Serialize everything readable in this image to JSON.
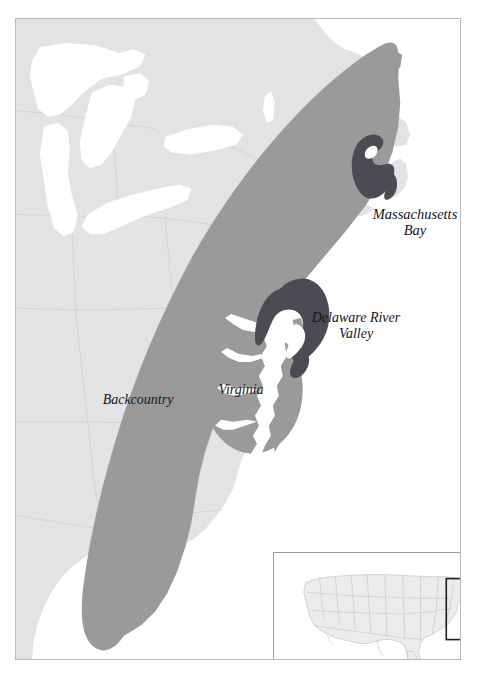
{
  "figure": {
    "kind": "thematic-map",
    "region": "Eastern North America",
    "frame_color": "#b9b9b9",
    "background_color": "#ffffff"
  },
  "palette": {
    "land": "#e3e3e3",
    "land_border": "#cfcfcf",
    "water": "#ffffff",
    "region_fill": "#9a9a9a",
    "hearth_fill": "#4b4b53",
    "inset_land": "#ececec",
    "inset_border": "#c3c3c3",
    "inset_frame": "#9d9d9d",
    "extent_box": "#1d1d1d",
    "label_color": "#16161a"
  },
  "labels": [
    {
      "id": "massachusetts-bay",
      "text": "Massachusetts\nBay",
      "x": 415,
      "y": 221
    },
    {
      "id": "delaware-river-valley",
      "text": "Delaware River\nValley",
      "x": 356,
      "y": 325
    },
    {
      "id": "virginia",
      "text": "Virginia",
      "x": 241,
      "y": 390
    },
    {
      "id": "backcountry",
      "text": "Backcountry",
      "x": 138,
      "y": 400
    }
  ],
  "regions": [
    {
      "id": "backcountry",
      "name": "Backcountry",
      "fill": "#9a9a9a",
      "style": "band"
    },
    {
      "id": "virginia",
      "name": "Virginia",
      "fill": "#9a9a9a",
      "style": "oval"
    },
    {
      "id": "delaware-river-valley",
      "name": "Delaware River Valley",
      "fill": "#4b4b53",
      "style": "blob"
    },
    {
      "id": "massachusetts-bay",
      "name": "Massachusetts Bay",
      "fill": "#4b4b53",
      "style": "blob"
    }
  ],
  "water_features": [
    {
      "id": "lake-superior",
      "name": "Lake Superior"
    },
    {
      "id": "lake-michigan",
      "name": "Lake Michigan"
    },
    {
      "id": "lake-huron",
      "name": "Lake Huron"
    },
    {
      "id": "lake-erie",
      "name": "Lake Erie"
    },
    {
      "id": "lake-ontario",
      "name": "Lake Ontario"
    },
    {
      "id": "chesapeake-bay",
      "name": "Chesapeake Bay"
    },
    {
      "id": "delaware-bay",
      "name": "Delaware Bay"
    },
    {
      "id": "atlantic-ocean",
      "name": "Atlantic Ocean"
    }
  ],
  "inset": {
    "id": "locator-inset",
    "name": "United States locator map",
    "extent_box": {
      "x": 174,
      "y": 26,
      "width": 79,
      "height": 62
    }
  }
}
